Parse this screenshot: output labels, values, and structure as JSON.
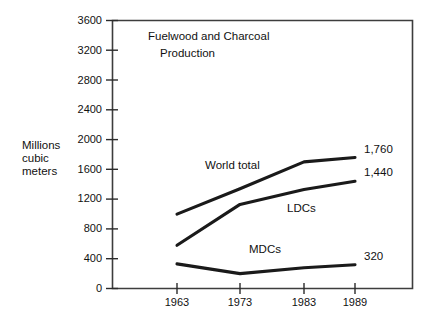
{
  "chart_data": {
    "type": "line",
    "title": "Fuelwood and Charcoal Production",
    "title_lines": [
      "Fuelwood and Charcoal",
      "Production"
    ],
    "xlabel": "",
    "ylabel": "Millions cubic meters",
    "ylabel_lines": [
      "Millions",
      "cubic",
      "meters"
    ],
    "x": [
      1963,
      1973,
      1983,
      1989
    ],
    "xtick_labels": [
      "1963",
      "1973",
      "1983",
      "1989"
    ],
    "ytick_labels": [
      "0",
      "400",
      "800",
      "1200",
      "1600",
      "2000",
      "2400",
      "2800",
      "3200",
      "3600"
    ],
    "ytick_values": [
      0,
      400,
      800,
      1200,
      1600,
      2000,
      2400,
      2800,
      3200,
      3600
    ],
    "ylim": [
      0,
      3600
    ],
    "xlim": [
      1960,
      1998
    ],
    "grid": false,
    "legend": "inline-series-labels",
    "series": [
      {
        "name": "World total",
        "values": [
          1000,
          1340,
          1700,
          1760
        ],
        "end_label": "1,760",
        "label": "World total"
      },
      {
        "name": "LDCs",
        "values": [
          580,
          1130,
          1330,
          1440
        ],
        "end_label": "1,440",
        "label": "LDCs"
      },
      {
        "name": "MDCs",
        "values": [
          330,
          200,
          280,
          320
        ],
        "end_label": "320",
        "label": "MDCs"
      }
    ],
    "line_color": "#1a1a1a",
    "frame_color": "#3a3a3a",
    "background": "#ffffff"
  },
  "axis": {
    "y_ticks": {
      "t0": "0",
      "t1": "400",
      "t2": "800",
      "t3": "1200",
      "t4": "1600",
      "t5": "2000",
      "t6": "2400",
      "t7": "2800",
      "t8": "3200",
      "t9": "3600"
    },
    "x_ticks": {
      "t0": "1963",
      "t1": "1973",
      "t2": "1983",
      "t3": "1989"
    },
    "y_title": {
      "line1": "Millions",
      "line2": "cubic",
      "line3": "meters"
    }
  },
  "title": {
    "line1": "Fuelwood and Charcoal",
    "line2": "Production"
  },
  "series_labels": {
    "world_total": "World total",
    "ldcs": "LDCs",
    "mdcs": "MDCs"
  },
  "value_labels": {
    "world_total": "1,760",
    "ldcs": "1,440",
    "mdcs": "320"
  }
}
